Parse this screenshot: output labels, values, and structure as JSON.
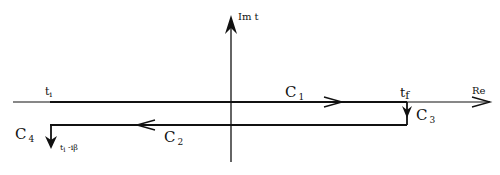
{
  "axes": {
    "imaginary_label": "Im t",
    "real_label": "Re"
  },
  "contour": {
    "segments": [
      {
        "id": "C1",
        "letter": "C",
        "sub": "1",
        "direction": "right"
      },
      {
        "id": "C2",
        "letter": "C",
        "sub": "2",
        "direction": "left"
      },
      {
        "id": "C3",
        "letter": "C",
        "sub": "3",
        "direction": "down"
      },
      {
        "id": "C4",
        "letter": "C",
        "sub": "4",
        "direction": "down"
      }
    ],
    "points": {
      "t_initial": {
        "base": "t",
        "sub": "i"
      },
      "t_final": {
        "base": "t",
        "sub": "f"
      },
      "t_initial_shifted": {
        "base": "t",
        "sub": "i",
        "suffix": " -iβ"
      }
    }
  },
  "colors": {
    "line": "#111111",
    "background": "#ffffff"
  }
}
